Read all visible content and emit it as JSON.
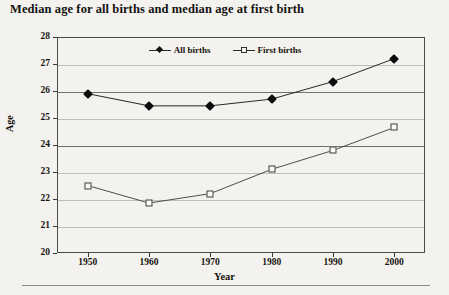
{
  "chart_data": {
    "type": "line",
    "title": "Median age for all births and median age at first birth",
    "xlabel": "Year",
    "ylabel": "Age",
    "x": [
      1950,
      1960,
      1970,
      1980,
      1990,
      2000
    ],
    "xtick_labels": [
      "1950",
      "1960",
      "1970",
      "1980",
      "1990",
      "2000"
    ],
    "xlim": [
      1945,
      2005
    ],
    "ylim": [
      20,
      28
    ],
    "ytick_labels": [
      "20",
      "21",
      "22",
      "23",
      "24",
      "25",
      "26",
      "27",
      "28"
    ],
    "ytick_values": [
      20,
      21,
      22,
      23,
      24,
      25,
      26,
      27,
      28
    ],
    "grid": true,
    "legend_position": "top-center",
    "series": [
      {
        "name": "All births",
        "marker": "filled-diamond",
        "line_style": "solid",
        "color": "#111111",
        "values": [
          25.9,
          25.45,
          25.45,
          25.7,
          26.35,
          27.2
        ]
      },
      {
        "name": "First births",
        "marker": "open-square",
        "line_style": "solid",
        "color": "#3a3a3a",
        "values": [
          22.5,
          21.85,
          22.2,
          23.1,
          23.8,
          24.65
        ]
      }
    ]
  }
}
